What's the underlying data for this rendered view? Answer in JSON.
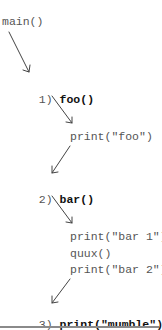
{
  "diagram": {
    "root": "main()",
    "steps": [
      {
        "number": "1)",
        "call": "foo()"
      },
      {
        "number": "2)",
        "call": "bar()"
      },
      {
        "number": "3)",
        "call": "print(\"mumble\")"
      }
    ],
    "foo_body": [
      "print(\"foo\")"
    ],
    "bar_body": [
      "print(\"bar 1\")",
      "quux()",
      "print(\"bar 2\")"
    ],
    "colors": {
      "text_gray": "#555555",
      "text_bold": "#111111",
      "arrow": "#444444",
      "rule": "#8a8a8a"
    }
  }
}
